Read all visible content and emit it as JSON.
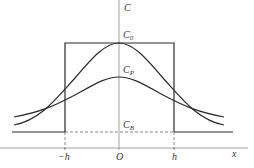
{
  "diagram": {
    "axis_labels": {
      "y": "C",
      "x": "x",
      "origin": "O"
    },
    "tick_labels": {
      "neg_h": "−h",
      "pos_h": "h"
    },
    "level_labels": {
      "c0": {
        "main": "C",
        "sub": "0"
      },
      "cp": {
        "main": "C",
        "sub": "P"
      },
      "cb": {
        "main": "C",
        "sub": "B"
      }
    },
    "colors": {
      "line": "#2a2a2a",
      "axis": "#8a8a8a",
      "text": "#333333"
    }
  }
}
